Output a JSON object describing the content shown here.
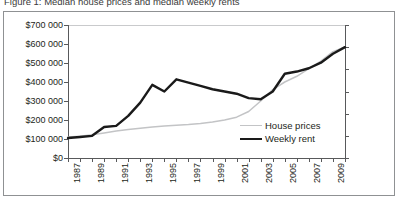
{
  "caption": {
    "text": "Figure 1: Median house prices and median weekly rents"
  },
  "chart_data": {
    "type": "line",
    "title": "",
    "xlabel": "",
    "ylabel": "House prices",
    "y2label": "Weekly rent",
    "grid": false,
    "legend_position": "inside-bottom-right",
    "x": [
      1987,
      1988,
      1989,
      1990,
      1991,
      1992,
      1993,
      1994,
      1995,
      1996,
      1997,
      1998,
      1999,
      2000,
      2001,
      2002,
      2003,
      2004,
      2005,
      2006,
      2007,
      2008,
      2009,
      2010
    ],
    "xtick_labels": [
      "1987",
      "1989",
      "1991",
      "1993",
      "1995",
      "1997",
      "1999",
      "2001",
      "2003",
      "2005",
      "2007",
      "2009"
    ],
    "xlim": [
      1987,
      2010
    ],
    "ylim": [
      0,
      700000
    ],
    "ytick_labels": [
      "$0",
      "$100 000",
      "$200 000",
      "$300 000",
      "$400 000",
      "$500 000",
      "$600 000",
      "$700 000"
    ],
    "ytick_values": [
      0,
      100000,
      200000,
      300000,
      400000,
      500000,
      600000,
      700000
    ],
    "y2lim": [
      0,
      600
    ],
    "y2tick_labels": [
      "$0",
      "$100",
      "$200",
      "$300",
      "$400",
      "$500",
      "$600"
    ],
    "y2tick_values": [
      0,
      100,
      200,
      300,
      400,
      500,
      600
    ],
    "series": [
      {
        "name": "House prices",
        "axis": "left",
        "color": "#c3c4c6",
        "width": 1.5,
        "values": [
          110000,
          115000,
          122000,
          132000,
          142000,
          150000,
          157000,
          163000,
          168000,
          172000,
          176000,
          182000,
          190000,
          200000,
          215000,
          245000,
          300000,
          360000,
          400000,
          430000,
          470000,
          510000,
          560000,
          585000
        ]
      },
      {
        "name": "Weekly rent",
        "axis": "right",
        "color": "#1a1a1a",
        "width": 2.4,
        "values": [
          90,
          95,
          100,
          140,
          145,
          190,
          250,
          330,
          300,
          355,
          340,
          325,
          310,
          300,
          290,
          270,
          265,
          300,
          380,
          390,
          405,
          430,
          470,
          500
        ]
      }
    ]
  },
  "legend": {
    "items": [
      {
        "label": "House prices"
      },
      {
        "label": "Weekly rent"
      }
    ]
  }
}
